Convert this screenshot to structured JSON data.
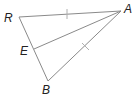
{
  "diagram": {
    "type": "geometry-triangle",
    "colors": {
      "line": "#8a8a8a",
      "tick": "#b0b0b0",
      "label": "#222222",
      "background": "#ffffff"
    },
    "points": [
      {
        "id": "R",
        "label": "R",
        "x": 19,
        "y": 17
      },
      {
        "id": "A",
        "label": "A",
        "x": 121,
        "y": 11
      },
      {
        "id": "E",
        "label": "E",
        "x": 34,
        "y": 49
      },
      {
        "id": "B",
        "label": "B",
        "x": 48,
        "y": 81
      }
    ],
    "segments": [
      {
        "from": "R",
        "to": "A",
        "tick_marks": 1
      },
      {
        "from": "A",
        "to": "B",
        "tick_marks": 1
      },
      {
        "from": "R",
        "to": "B",
        "tick_marks": 0
      },
      {
        "from": "A",
        "to": "E",
        "tick_marks": 0
      }
    ],
    "labels": {
      "R": "R",
      "A": "A",
      "E": "E",
      "B": "B"
    }
  }
}
